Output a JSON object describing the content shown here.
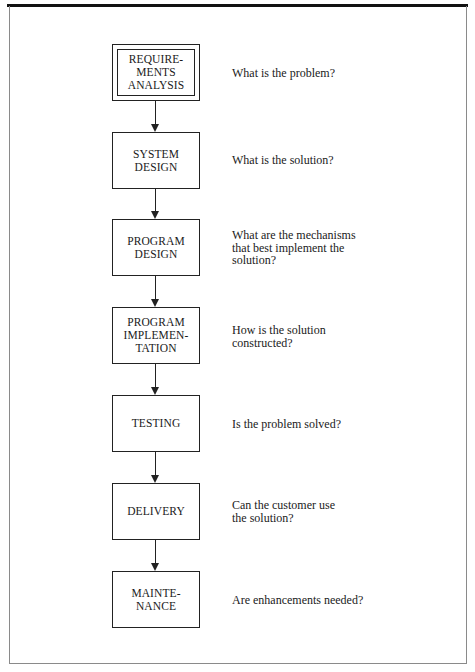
{
  "diagram": {
    "type": "waterfall-flowchart",
    "stages": [
      {
        "id": "requirements-analysis",
        "label": "REQUIRE-\nMENTS\nANALYSIS",
        "question": "What is the problem?",
        "double_border": true
      },
      {
        "id": "system-design",
        "label": "SYSTEM\nDESIGN",
        "question": "What is the solution?"
      },
      {
        "id": "program-design",
        "label": "PROGRAM\nDESIGN",
        "question": "What are the mechanisms\nthat best implement the\nsolution?"
      },
      {
        "id": "program-implementation",
        "label": "PROGRAM\nIMPLEMEN-\nTATION",
        "question": "How is the solution\nconstructed?"
      },
      {
        "id": "testing",
        "label": "TESTING",
        "question": "Is the problem solved?"
      },
      {
        "id": "delivery",
        "label": "DELIVERY",
        "question": "Can the customer use\nthe solution?"
      },
      {
        "id": "maintenance",
        "label": "MAINTE-\nNANCE",
        "question": "Are enhancements needed?"
      }
    ],
    "connections": [
      {
        "from": "requirements-analysis",
        "to": "system-design"
      },
      {
        "from": "system-design",
        "to": "program-design"
      },
      {
        "from": "program-design",
        "to": "program-implementation"
      },
      {
        "from": "program-implementation",
        "to": "testing"
      },
      {
        "from": "testing",
        "to": "delivery"
      },
      {
        "from": "delivery",
        "to": "maintenance"
      }
    ],
    "colors": {
      "line": "#222222",
      "frame": "#8a8a8a",
      "background": "#ffffff"
    }
  }
}
